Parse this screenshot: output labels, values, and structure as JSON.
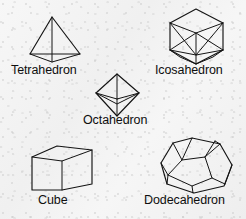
{
  "figure": {
    "background_color": "#f3f3f3",
    "line_color": "#141414",
    "style": "black-and-white line drawing, wireframe perspective"
  },
  "solids": [
    {
      "id": "tetrahedron",
      "label": "Tetrahedron",
      "faces": 4,
      "face_shape": "triangle",
      "label_position": {
        "x": 11,
        "y": 64
      },
      "drawing": {
        "outline": "M 52,17 L 30,54 L 80,54 Z",
        "inner_edges": [
          "M 30,54 L 52,62 L 80,54",
          "M 52,17 L 52,62"
        ]
      }
    },
    {
      "id": "icosahedron",
      "label": "Icosahedron",
      "faces": 20,
      "face_shape": "triangle",
      "label_position": {
        "x": 155,
        "y": 64
      },
      "drawing": {
        "outline": "M 196,9 L 223,23 L 223,50 L 196,64 L 170,50 L 170,23 Z",
        "inner_edges": [
          "M 170,23 L 196,33 L 223,23",
          "M 170,50 L 196,33 L 223,50",
          "M 196,33 L 196,55",
          "M 170,23 L 196,55 L 223,23",
          "M 170,50 L 196,55 L 223,50",
          "M 196,55 L 196,64",
          "M 170,50 L 180,57 L 196,64 L 213,57 L 223,50"
        ]
      }
    },
    {
      "id": "octahedron",
      "label": "Octahedron",
      "faces": 8,
      "face_shape": "triangle",
      "label_position": {
        "x": 83,
        "y": 114
      },
      "drawing": {
        "outline": "M 117,74 L 139,93 L 117,116 L 96,93 Z",
        "inner_edges": [
          "M 96,93 L 117,99 L 139,93",
          "M 117,74 L 117,99",
          "M 117,99 L 117,116",
          "M 96,93 L 117,104 L 139,93"
        ]
      }
    },
    {
      "id": "cube",
      "label": "Cube",
      "faces": 6,
      "face_shape": "square",
      "label_position": {
        "x": 38,
        "y": 194
      },
      "drawing": {
        "outline": "M 32,157 L 57,146 L 92,150 L 92,184 L 62,190 L 32,190 Z",
        "inner_edges": [
          "M 32,157 L 62,161 L 92,150",
          "M 62,161 L 62,190"
        ]
      }
    },
    {
      "id": "dodecahedron",
      "label": "Dodecahedron",
      "faces": 12,
      "face_shape": "pentagon",
      "label_position": {
        "x": 144,
        "y": 194
      },
      "drawing": {
        "outline": "M 192,138 L 220,144 L 232,165 L 224,186 L 194,193 L 167,184 L 161,163 L 173,143 Z",
        "inner_edges": [
          "M 173,143 L 182,160 L 168,175",
          "M 182,160 L 205,157 L 215,141",
          "M 205,157 L 212,178 L 225,184",
          "M 212,178 L 192,186 L 193,193",
          "M 192,186 L 168,175 L 167,184",
          "M 182,160 L 192,138",
          "M 161,163 L 168,175",
          "M 220,144 L 215,141",
          "M 232,165 L 225,184",
          "M 205,157 L 220,144"
        ]
      }
    }
  ]
}
